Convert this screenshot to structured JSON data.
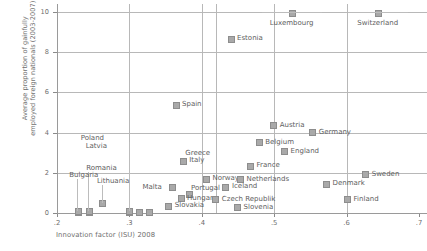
{
  "chart_data": {
    "type": "scatter",
    "title": "",
    "xlabel": "Innovation factor (ISU) 2008",
    "ylabel": "Average proportion of gainfully\nemployed foreign nationals (2003-2007)",
    "xlim": [
      0.2,
      0.7
    ],
    "ylim": [
      0,
      10
    ],
    "xticks": [
      ".2",
      ".3",
      ".4",
      ".5",
      ".6",
      ".7"
    ],
    "xtick_values": [
      0.2,
      0.3,
      0.4,
      0.5,
      0.6,
      0.7
    ],
    "yticks": [
      "0",
      "2",
      "4",
      "6",
      "8",
      "10"
    ],
    "ytick_values": [
      0,
      2,
      4,
      6,
      8,
      10
    ],
    "grid": "both",
    "legend": "none",
    "marker_color": "#a9a9a9",
    "axis_color": "#9a9a9a",
    "grid_color": "#b8b8b8",
    "text_color": "#6e6e6e",
    "points": [
      {
        "name": "Luxembourg",
        "x": 0.524,
        "y": 10.0,
        "lx": 12,
        "ly": 8,
        "anchor": "center"
      },
      {
        "name": "Switzerland",
        "x": 0.643,
        "y": 10.0,
        "lx": 12,
        "ly": 8,
        "anchor": "center"
      },
      {
        "name": "Estonia",
        "x": 0.439,
        "y": 8.7,
        "lx": 7,
        "ly": -3,
        "anchor": "left"
      },
      {
        "name": "Spain",
        "x": 0.363,
        "y": 5.4,
        "lx": 7,
        "ly": -3,
        "anchor": "left"
      },
      {
        "name": "Austria",
        "x": 0.498,
        "y": 4.4,
        "lx": 7,
        "ly": -3,
        "anchor": "left"
      },
      {
        "name": "Germany",
        "x": 0.552,
        "y": 4.05,
        "lx": 7,
        "ly": -3,
        "anchor": "left"
      },
      {
        "name": "Belgium",
        "x": 0.478,
        "y": 3.55,
        "lx": 7,
        "ly": -3,
        "anchor": "left"
      },
      {
        "name": "England",
        "x": 0.513,
        "y": 3.1,
        "lx": 7,
        "ly": -3,
        "anchor": "left"
      },
      {
        "name": "Greece",
        "x": 0.373,
        "y": 2.62,
        "lx": 3,
        "ly": -10,
        "anchor": "left"
      },
      {
        "name": "Italy",
        "x": 0.373,
        "y": 2.62,
        "lx": 7,
        "ly": -3,
        "anchor": "left"
      },
      {
        "name": "France",
        "x": 0.466,
        "y": 2.38,
        "lx": 7,
        "ly": -3,
        "anchor": "left"
      },
      {
        "name": "Poland",
        "x": 0.299,
        "y": 0.12,
        "lx": -48,
        "ly": -76,
        "anchor": "leader"
      },
      {
        "name": "Latvia",
        "x": 0.299,
        "y": 0.1,
        "lx": -43,
        "ly": -68,
        "anchor": "leader"
      },
      {
        "name": "Malta",
        "x": 0.358,
        "y": 1.3,
        "lx": -29,
        "ly": -3,
        "anchor": "right"
      },
      {
        "name": "Norway",
        "x": 0.405,
        "y": 1.72,
        "lx": 7,
        "ly": -3,
        "anchor": "left"
      },
      {
        "name": "Netherlands",
        "x": 0.452,
        "y": 1.7,
        "lx": 7,
        "ly": -3,
        "anchor": "left"
      },
      {
        "name": "Sweden",
        "x": 0.625,
        "y": 1.95,
        "lx": 7,
        "ly": -3,
        "anchor": "left"
      },
      {
        "name": "Iceland",
        "x": 0.432,
        "y": 1.32,
        "lx": 7,
        "ly": -3,
        "anchor": "left"
      },
      {
        "name": "Denmark",
        "x": 0.571,
        "y": 1.48,
        "lx": 7,
        "ly": -3,
        "anchor": "left"
      },
      {
        "name": "Portugal",
        "x": 0.381,
        "y": 0.95,
        "lx": 3,
        "ly": -9,
        "anchor": "left"
      },
      {
        "name": "Romania",
        "x": 0.243,
        "y": 0.1,
        "lx": -2,
        "ly": -46,
        "anchor": "leader"
      },
      {
        "name": "Bulgaria",
        "x": 0.228,
        "y": 0.1,
        "lx": -8,
        "ly": -39,
        "anchor": "leader"
      },
      {
        "name": "Lithuania",
        "x": 0.262,
        "y": 0.52,
        "lx": -5,
        "ly": -25,
        "anchor": "leader"
      },
      {
        "name": "Hungary",
        "x": 0.37,
        "y": 0.75,
        "lx": 7,
        "ly": -3,
        "anchor": "left"
      },
      {
        "name": "Czech Republik",
        "x": 0.418,
        "y": 0.72,
        "lx": 7,
        "ly": -3,
        "anchor": "left"
      },
      {
        "name": "Slovakia",
        "x": 0.353,
        "y": 0.38,
        "lx": 7,
        "ly": -3,
        "anchor": "left"
      },
      {
        "name": "Slovenia",
        "x": 0.448,
        "y": 0.32,
        "lx": 7,
        "ly": -3,
        "anchor": "left"
      },
      {
        "name": "Finland",
        "x": 0.6,
        "y": 0.72,
        "lx": 7,
        "ly": -3,
        "anchor": "left"
      }
    ],
    "extra_gridlines_x": [
      0.42
    ],
    "extra_markers_baseline": [
      {
        "x": 0.228,
        "y": 0.06
      },
      {
        "x": 0.243,
        "y": 0.06
      },
      {
        "x": 0.299,
        "y": 0.06
      },
      {
        "x": 0.312,
        "y": 0.06
      },
      {
        "x": 0.327,
        "y": 0.06
      }
    ]
  }
}
